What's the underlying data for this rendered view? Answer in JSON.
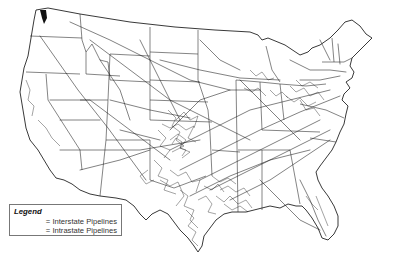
{
  "map": {
    "title": "",
    "subject": "United States natural gas pipeline network",
    "region": "Contiguous United States",
    "colors": {
      "background": "#ffffff",
      "outline": "#222222",
      "pipelines": "#1a1a1a"
    },
    "dense_regions": [
      "Texas",
      "Oklahoma",
      "Louisiana",
      "Kansas",
      "Appalachia (PA/WV/OH)",
      "Illinois / Michigan"
    ]
  },
  "legend": {
    "title": "Legend",
    "items": [
      {
        "symbol": "=",
        "label": "Interstate Pipelines"
      },
      {
        "symbol": "=",
        "label": "Intrastate Pipelines"
      }
    ]
  }
}
